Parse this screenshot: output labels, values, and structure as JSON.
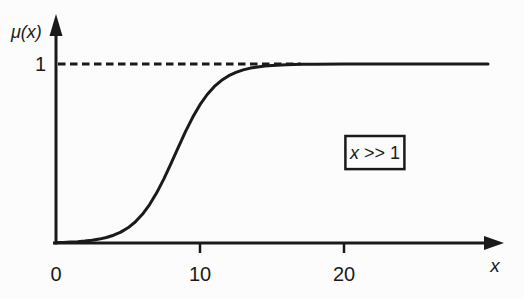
{
  "figure": {
    "background": "#fcfcfc",
    "ink_color": "#1a1a1a",
    "y_axis_label": "μ(x)",
    "x_axis_label": "x",
    "y_tick_label": "1",
    "annotation": {
      "text": "x >> 1",
      "var": "x",
      "rest": " >> 1"
    }
  },
  "chart_data": {
    "type": "line",
    "title": "",
    "xlabel": "x",
    "ylabel": "μ(x)",
    "xlim": [
      0,
      31
    ],
    "ylim": [
      0,
      1.27
    ],
    "x_ticks": [
      0,
      10,
      20
    ],
    "x_tick_marks": [
      10,
      20
    ],
    "y_ticks": [
      1
    ],
    "grid": false,
    "legend_position": "none",
    "reference_line": {
      "y": 1,
      "style": "dashed",
      "x_start": 0,
      "x_end": 17
    },
    "annotation": {
      "text": "x >> 1",
      "x_range": [
        20.1,
        24.2
      ],
      "y_range": [
        0.413,
        0.598
      ]
    },
    "series": [
      {
        "name": "membership degree μ(x) of fuzzy set \"x >> 1\"",
        "x": [
          0,
          0.5,
          1,
          1.5,
          2,
          2.5,
          3,
          3.5,
          4,
          4.5,
          5,
          5.5,
          6,
          6.5,
          7,
          7.5,
          8,
          8.5,
          9,
          9.5,
          10,
          10.5,
          11,
          11.5,
          12,
          12.5,
          13,
          13.5,
          14,
          14.5,
          15,
          16,
          17,
          18,
          20,
          22,
          24,
          26,
          28,
          30
        ],
        "y": [
          0.0025,
          0.0036,
          0.0052,
          0.0074,
          0.0106,
          0.0151,
          0.0216,
          0.0306,
          0.0433,
          0.0609,
          0.085,
          0.1175,
          0.1603,
          0.2148,
          0.2817,
          0.3598,
          0.4462,
          0.5359,
          0.6234,
          0.7036,
          0.7728,
          0.8298,
          0.8747,
          0.9092,
          0.9348,
          0.9536,
          0.9672,
          0.9769,
          0.9838,
          0.9886,
          0.992,
          0.9961,
          0.9981,
          0.9991,
          0.9998,
          1,
          1,
          1,
          1,
          1
        ]
      }
    ]
  }
}
